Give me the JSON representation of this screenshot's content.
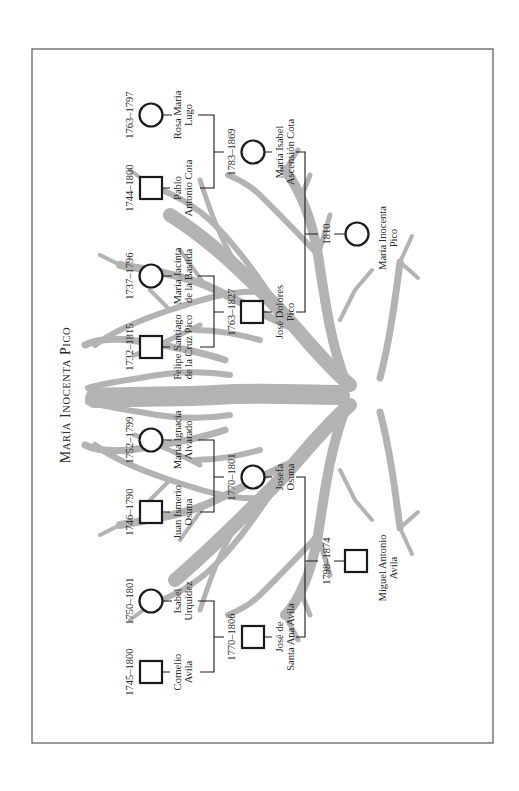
{
  "title": {
    "first_cap": "M",
    "first_rest": "ARÍA",
    "second_cap": "I",
    "second_rest": "NOCENTA",
    "third_cap": "P",
    "third_rest": "ICO",
    "full": "María Inocenta Pico"
  },
  "colors": {
    "tree": "#b3b3b3",
    "line": "#1a1a1a",
    "frame": "#555555",
    "background": "#ffffff"
  },
  "legend": {
    "male_symbol": "square",
    "female_symbol": "circle"
  },
  "people": {
    "rosa": {
      "name1": "Rosa María",
      "name2": "Lugo",
      "dates": "1763–1797",
      "sex": "female",
      "generation": 1
    },
    "pablo": {
      "name1": "Pablo",
      "name2": "Antonio Cota",
      "dates": "1744–1800",
      "sex": "male",
      "generation": 1
    },
    "jacinta": {
      "name1": "María Jacinta",
      "name2": "de la Bastida",
      "dates": "1737–1796",
      "sex": "female",
      "generation": 1
    },
    "felipe": {
      "name1": "Felipe Santiago",
      "name2": "de la Cruz Pico",
      "dates": "1732–1815",
      "sex": "male",
      "generation": 1
    },
    "ignacia": {
      "name1": "María Ignacia",
      "name2": "Alvarado",
      "dates": "1752–1799",
      "sex": "female",
      "generation": 1
    },
    "ismerio": {
      "name1": "Juan Ismerio",
      "name2": "Osuna",
      "dates": "1746–1790",
      "sex": "male",
      "generation": 1
    },
    "isabel_u": {
      "name1": "Isabel",
      "name2": "Urquidez",
      "dates": "1750–1801",
      "sex": "female",
      "generation": 1
    },
    "cornelio": {
      "name1": "Cornelio",
      "name2": "Avila",
      "dates": "1745–1800",
      "sex": "male",
      "generation": 1
    },
    "isabel_c": {
      "name1": "María Isabel",
      "name2": "Ascensión Cota",
      "dates": "1783–1869",
      "sex": "female",
      "generation": 2
    },
    "dolores": {
      "name1": "José Dolores",
      "name2": "Pico",
      "dates": "1763–1827",
      "sex": "male",
      "generation": 2
    },
    "josefa": {
      "name1": "Josefa",
      "name2": "Osuna",
      "dates": "1770–1801",
      "sex": "female",
      "generation": 2
    },
    "santa_ana": {
      "name1": "José de",
      "name2": "Santa Ana Avila",
      "dates": "1770–1806",
      "sex": "male",
      "generation": 2
    },
    "inocenta": {
      "name1": "María Inocenta",
      "name2": "Pico",
      "dates": "1810",
      "sex": "female",
      "generation": 3
    },
    "miguel": {
      "name1": "Miguel Antonio",
      "name2": "Avila",
      "dates": "1798–1874",
      "sex": "male",
      "generation": 3
    }
  },
  "couples": [
    {
      "partners": [
        "pablo",
        "rosa"
      ],
      "child": "isabel_c"
    },
    {
      "partners": [
        "felipe",
        "jacinta"
      ],
      "child": "dolores"
    },
    {
      "partners": [
        "ismerio",
        "ignacia"
      ],
      "child": "josefa"
    },
    {
      "partners": [
        "cornelio",
        "isabel_u"
      ],
      "child": "santa_ana"
    },
    {
      "partners": [
        "dolores",
        "isabel_c"
      ],
      "child": "inocenta"
    },
    {
      "partners": [
        "santa_ana",
        "josefa"
      ],
      "child": "miguel"
    }
  ]
}
